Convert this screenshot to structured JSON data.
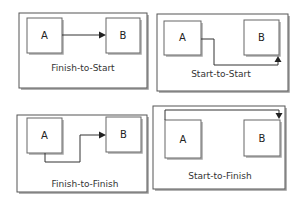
{
  "diagram": {
    "panels": [
      {
        "id": "finish-to-start",
        "caption": "Finish-to-Start",
        "task_a": "A",
        "task_b": "B",
        "from": "A finish",
        "to": "B start"
      },
      {
        "id": "start-to-start",
        "caption": "Start-to-Start",
        "task_a": "A",
        "task_b": "B",
        "from": "A start",
        "to": "B start"
      },
      {
        "id": "finish-to-finish",
        "caption": "Finish-to-Finish",
        "task_a": "A",
        "task_b": "B",
        "from": "A finish",
        "to": "B finish"
      },
      {
        "id": "start-to-finish",
        "caption": "Start-to-Finish",
        "task_a": "A",
        "task_b": "B",
        "from": "A start",
        "to": "B finish"
      }
    ]
  }
}
